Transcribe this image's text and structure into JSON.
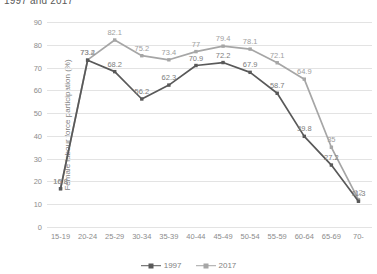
{
  "chart_data": {
    "type": "line",
    "title": "1997 and 2017",
    "xlabel": "",
    "ylabel": "Female labour force participation (%)",
    "ylim": [
      0,
      90
    ],
    "ytick_step": 10,
    "yticks": [
      "0",
      "10",
      "20",
      "30",
      "40",
      "50",
      "60",
      "70",
      "80",
      "90"
    ],
    "grid": "horizontal",
    "legend_position": "bottom",
    "categories": [
      "15-19",
      "20-24",
      "25-29",
      "30-34",
      "35-39",
      "40-44",
      "45-49",
      "50-54",
      "55-59",
      "60-64",
      "65-69",
      "70-"
    ],
    "series": [
      {
        "name": "1997",
        "color": "#595959",
        "values": [
          16.8,
          73.2,
          68.2,
          56.2,
          62.3,
          70.9,
          72.2,
          67.9,
          58.7,
          39.8,
          27.2,
          11.3
        ],
        "labels": [
          "16.8",
          "73.2",
          "68.2",
          "56.2",
          "62.3",
          "70.9",
          "72.2",
          "67.9",
          "58.7",
          "39.8",
          "27.2",
          "11.3"
        ]
      },
      {
        "name": "2017",
        "color": "#a6a6a6",
        "values": [
          16.8,
          73.4,
          82.1,
          75.2,
          73.4,
          77,
          79.4,
          78.1,
          72.1,
          64.9,
          35,
          12
        ],
        "labels": [
          "16.8",
          "73.4",
          "82.1",
          "75.2",
          "73.4",
          "77",
          "79.4",
          "78.1",
          "72.1",
          "64.9",
          "35",
          "12"
        ]
      }
    ]
  },
  "legend": {
    "items": [
      {
        "label": "1997",
        "color": "#595959"
      },
      {
        "label": "2017",
        "color": "#a6a6a6"
      }
    ]
  }
}
